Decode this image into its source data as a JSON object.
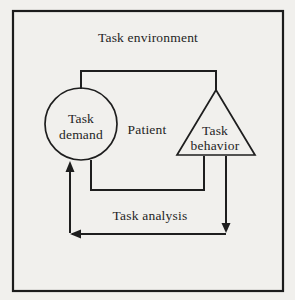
{
  "diagram": {
    "environment_label": "Task environment",
    "analysis_label": "Task analysis",
    "nodes": {
      "task_demand": {
        "shape": "circle",
        "line1": "Task",
        "line2": "demand"
      },
      "patient": {
        "shape": "text-only",
        "line1": "Patient"
      },
      "task_behavior": {
        "shape": "triangle",
        "line1": "Task",
        "line2": "behavior"
      }
    },
    "flow": {
      "from": "Task behavior",
      "via": "Task analysis",
      "to": "Task demand"
    },
    "colors": {
      "background": "#f1f0ed",
      "ink": "#1e1e1e"
    }
  }
}
